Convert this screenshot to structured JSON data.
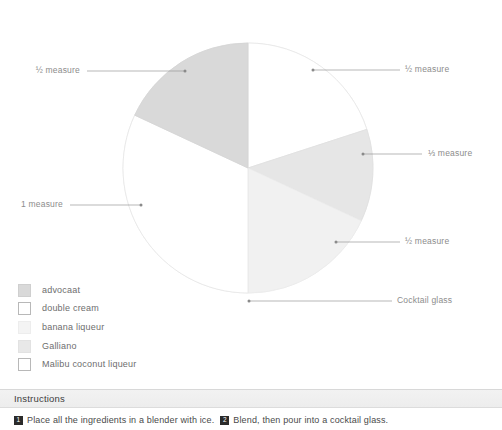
{
  "chart_data": {
    "type": "pie",
    "title": "",
    "legend_position": "below-left",
    "center": {
      "x": 248,
      "y": 168
    },
    "radius": 125,
    "categories": [
      "double cream",
      "banana liqueur",
      "Galliano",
      "Malibu coconut liqueur",
      "advocaat"
    ],
    "labels": [
      "½ measure",
      "⅓ measure",
      "½ measure",
      "1 measure",
      "½ measure"
    ],
    "values": [
      0.5,
      0.333,
      0.5,
      1,
      0.5
    ],
    "slices": [
      {
        "name": "double cream",
        "label": "½ measure",
        "value": 0.5,
        "color": "#ffffff",
        "stroke": "#e6e6e6",
        "start_deg": 0,
        "end_deg": 72
      },
      {
        "name": "banana liqueur",
        "label": "⅓ measure",
        "value": 0.333,
        "color": "#e6e6e6",
        "stroke": "#e0e0e0",
        "start_deg": 72,
        "end_deg": 115
      },
      {
        "name": "Galliano",
        "label": "½ measure",
        "value": 0.5,
        "color": "#f1f1f1",
        "stroke": "#ebebeb",
        "start_deg": 115,
        "end_deg": 180
      },
      {
        "name": "Malibu coconut liqueur",
        "label": "1 measure",
        "value": 1,
        "color": "#ffffff",
        "stroke": "#e6e6e6",
        "start_deg": 180,
        "end_deg": 295
      },
      {
        "name": "advocaat",
        "label": "½ measure",
        "value": 0.5,
        "color": "#d9d9d9",
        "stroke": "#d4d4d4",
        "start_deg": 295,
        "end_deg": 360
      }
    ],
    "annotations": [
      {
        "text": "½ measure",
        "side": "left",
        "target": "advocaat"
      },
      {
        "text": "1 measure",
        "side": "left",
        "target": "Malibu coconut liqueur"
      },
      {
        "text": "½ measure",
        "side": "right",
        "target": "double cream"
      },
      {
        "text": "⅓ measure",
        "side": "right",
        "target": "banana liqueur"
      },
      {
        "text": "½ measure",
        "side": "right",
        "target": "Galliano"
      },
      {
        "text": "Cocktail glass",
        "side": "right",
        "target": "glass-outline"
      }
    ]
  },
  "callouts": {
    "top_left": "½ measure",
    "mid_left": "1 measure",
    "top_right": "½ measure",
    "mid_right": "⅓ measure",
    "lower_right": "½ measure",
    "bottom_right": "Cocktail glass"
  },
  "legend": {
    "items": [
      {
        "label": "advocaat",
        "color": "#d9d9d9",
        "border": "#cfcfcf"
      },
      {
        "label": "double cream",
        "color": "#ffffff",
        "border": "#b8b8b8"
      },
      {
        "label": "banana liqueur",
        "color": "#f4f4f4",
        "border": "#ededed"
      },
      {
        "label": "Galliano",
        "color": "#e8e8e8",
        "border": "#e2e2e2"
      },
      {
        "label": "Malibu coconut liqueur",
        "color": "#ffffff",
        "border": "#b8b8b8"
      }
    ]
  },
  "instructions": {
    "title": "Instructions",
    "steps": [
      {
        "number": "1",
        "text": "Place all the ingredients in a blender with ice."
      },
      {
        "number": "2",
        "text": "Blend, then pour into a cocktail glass."
      }
    ]
  },
  "colors": {
    "label_text": "#8c8c8c",
    "legend_text": "#6e6e6e",
    "leader_line": "#9a9a9a",
    "header_band": "#f0f0f0",
    "body_text": "#4a4a4a",
    "badge_bg": "#2b2b2b"
  }
}
